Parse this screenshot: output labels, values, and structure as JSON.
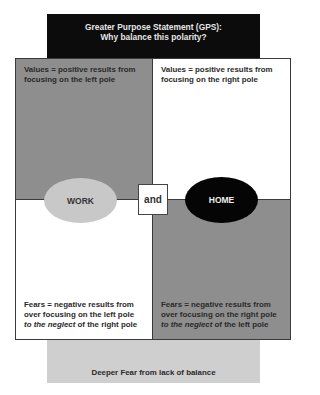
{
  "gps": {
    "line1": "Greater Purpose Statement (GPS):",
    "line2": "Why balance this polarity?"
  },
  "quadrants": {
    "top_left": {
      "line1": "Values = positive results from",
      "line2": "focusing on the left pole"
    },
    "top_right": {
      "line1": "Values = positive results from",
      "line2": "focusing on the right pole"
    },
    "bottom_left": {
      "line1": "Fears = negative results from",
      "line2": "over focusing on the left pole",
      "line3_em": "to the neglect",
      "line3_rest": " of the right pole"
    },
    "bottom_right": {
      "line1": "Fears = negative results from",
      "line2": "over focusing on the right pole",
      "line3_em": "to the neglect",
      "line3_rest": " of the left pole"
    }
  },
  "poles": {
    "left": "WORK",
    "connector": "and",
    "right": "HOME"
  },
  "deeper_fear": "Deeper Fear from lack of balance",
  "colors": {
    "gps_bg": "#0c0c0c",
    "quadrant_dark": "#8e8e8e",
    "quadrant_light": "#ffffff",
    "work_pole": "#c8c8c8",
    "home_pole": "#050505",
    "deeper_fear_bg": "#cfcfcf"
  }
}
